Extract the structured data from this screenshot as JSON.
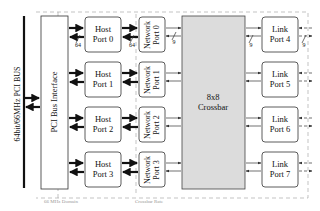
{
  "bus": {
    "label": "64bit/66MHz PCI BUS"
  },
  "pci_interface": {
    "label": "PCI Bus Interface"
  },
  "host_ports": [
    {
      "line1": "Host",
      "line2": "Port 0"
    },
    {
      "line1": "Host",
      "line2": "Port 1"
    },
    {
      "line1": "Host",
      "line2": "Port 2"
    },
    {
      "line1": "Host",
      "line2": "Port 3"
    }
  ],
  "network_ports": [
    {
      "line1": "Network",
      "line2": "Port 0"
    },
    {
      "line1": "Network",
      "line2": "Port 1"
    },
    {
      "line1": "Network",
      "line2": "Port 2"
    },
    {
      "line1": "Network",
      "line2": "Port 3"
    }
  ],
  "crossbar": {
    "line1": "8x8",
    "line2": "Crossbar"
  },
  "link_ports": [
    {
      "line1": "Link",
      "line2": "Port 4"
    },
    {
      "line1": "Link",
      "line2": "Port 5"
    },
    {
      "line1": "Link",
      "line2": "Port 6"
    },
    {
      "line1": "Link",
      "line2": "Port 7"
    }
  ],
  "width_labels": {
    "host_bus": "64",
    "host_network": "64",
    "network_crossbar": "9",
    "crossbar_link": "9",
    "link_out": "9"
  },
  "footer_labels": {
    "left": "66 MHz Domain",
    "middle": "Crossbar Rate"
  }
}
